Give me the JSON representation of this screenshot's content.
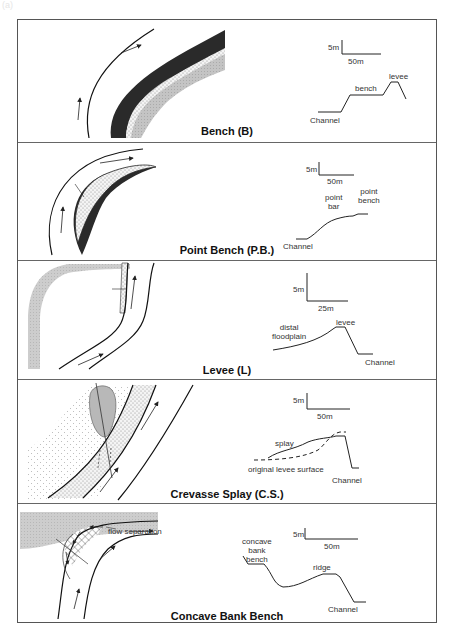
{
  "figure": {
    "label": "(a)"
  },
  "panels": [
    {
      "title": "Bench (B)",
      "scale": {
        "vertical": "5m",
        "horizontal": "50m"
      },
      "profile_labels": {
        "channel": "Channel",
        "bench": "bench",
        "levee": "levee"
      }
    },
    {
      "title": "Point Bench (P.B.)",
      "scale": {
        "vertical": "5m",
        "horizontal": "50m"
      },
      "profile_labels": {
        "channel": "Channel",
        "point_bar": "point\nbar",
        "point_bench": "point\nbench"
      }
    },
    {
      "title": "Levee (L)",
      "scale": {
        "vertical": "5m",
        "horizontal": "25m"
      },
      "profile_labels": {
        "distal_floodplain": "distal\nfloodplain",
        "levee": "levee",
        "channel": "Channel"
      }
    },
    {
      "title": "Crevasse Splay (C.S.)",
      "scale": {
        "vertical": "5m",
        "horizontal": "50m"
      },
      "profile_labels": {
        "splay": "splay",
        "original_levee_surface": "original levee surface",
        "channel": "Channel"
      }
    },
    {
      "title": "Concave Bank Bench",
      "scale": {
        "vertical": "5m",
        "horizontal": "50m"
      },
      "plan_labels": {
        "flow_separation": "flow separation"
      },
      "profile_labels": {
        "concave_bank_bench": "concave\nbank\nbench",
        "ridge": "ridge",
        "channel": "Channel"
      }
    }
  ],
  "colors": {
    "frame": "#555555",
    "dark_fill": "#2a2a2a",
    "light_gray": "#c8c8c8",
    "stipple": "#999999"
  }
}
